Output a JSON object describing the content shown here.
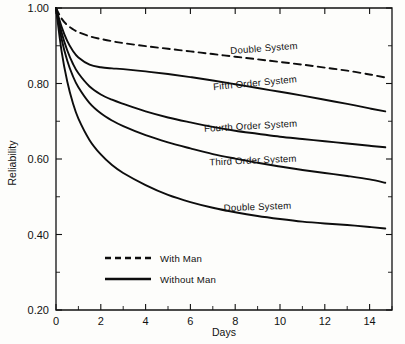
{
  "chart_data": {
    "type": "line",
    "title": "",
    "xlabel": "Days",
    "ylabel": "Reliability",
    "xlim": [
      0,
      15
    ],
    "ylim": [
      0.2,
      1.0
    ],
    "grid": false,
    "legend_position": "inside-lower-left",
    "x_ticks": [
      0,
      2,
      4,
      6,
      8,
      10,
      12,
      14
    ],
    "x_tick_labels": [
      "0",
      "2",
      "4",
      "6",
      "8",
      "10",
      "12",
      "14"
    ],
    "x_minor_ticks": [
      1,
      3,
      5,
      7,
      9,
      11,
      13,
      15
    ],
    "y_ticks": [
      0.2,
      0.4,
      0.6,
      0.8,
      1.0
    ],
    "y_tick_labels": [
      "0.20",
      "0.40",
      "0.60",
      "0.80",
      "1.00"
    ],
    "y_minor_ticks": [
      0.3,
      0.5,
      0.7,
      0.9
    ],
    "x": [
      0,
      0.25,
      0.5,
      0.75,
      1,
      1.5,
      2,
      2.5,
      3,
      4,
      5,
      6,
      7,
      8,
      9,
      10,
      11,
      12,
      13,
      14,
      14.7
    ],
    "series": [
      {
        "name": "Double System",
        "label": "Double System",
        "style": "dashed",
        "group": "With Man",
        "values": [
          1.0,
          0.972,
          0.955,
          0.944,
          0.936,
          0.925,
          0.918,
          0.912,
          0.907,
          0.899,
          0.892,
          0.885,
          0.878,
          0.871,
          0.864,
          0.857,
          0.85,
          0.842,
          0.834,
          0.824,
          0.816
        ]
      },
      {
        "name": "Fifth Order System",
        "label": "Fifth Order System",
        "style": "solid",
        "group": "Without Man",
        "values": [
          1.0,
          0.95,
          0.913,
          0.887,
          0.869,
          0.85,
          0.843,
          0.84,
          0.838,
          0.832,
          0.825,
          0.817,
          0.808,
          0.798,
          0.788,
          0.778,
          0.768,
          0.757,
          0.746,
          0.734,
          0.726
        ]
      },
      {
        "name": "Fourth Order System",
        "label": "Fourth Order System",
        "style": "solid",
        "group": "Without Man",
        "values": [
          1.0,
          0.935,
          0.888,
          0.853,
          0.827,
          0.792,
          0.771,
          0.757,
          0.746,
          0.726,
          0.71,
          0.697,
          0.685,
          0.675,
          0.667,
          0.659,
          0.653,
          0.647,
          0.641,
          0.635,
          0.631
        ]
      },
      {
        "name": "Third Order System",
        "label": "Third Order System",
        "style": "solid",
        "group": "Without Man",
        "values": [
          1.0,
          0.918,
          0.861,
          0.82,
          0.79,
          0.748,
          0.721,
          0.702,
          0.687,
          0.663,
          0.644,
          0.628,
          0.613,
          0.601,
          0.59,
          0.58,
          0.571,
          0.563,
          0.555,
          0.546,
          0.537
        ]
      },
      {
        "name": "Double System (Without Man)",
        "label": "Double System",
        "style": "solid",
        "group": "Without Man",
        "values": [
          1.0,
          0.885,
          0.806,
          0.749,
          0.707,
          0.65,
          0.612,
          0.584,
          0.563,
          0.531,
          0.505,
          0.486,
          0.471,
          0.459,
          0.449,
          0.441,
          0.434,
          0.429,
          0.425,
          0.42,
          0.416
        ]
      }
    ],
    "annotations": [
      {
        "text": "Double System",
        "x": 9.3,
        "y": 0.885,
        "rotation": -4.5
      },
      {
        "text": "Fifth Order System",
        "x": 8.9,
        "y": 0.793,
        "rotation": -5.5
      },
      {
        "text": "Fourth Order System",
        "x": 8.7,
        "y": 0.679,
        "rotation": -3.2
      },
      {
        "text": "Third Order System",
        "x": 8.8,
        "y": 0.588,
        "rotation": -2.6
      },
      {
        "text": "Double System",
        "x": 9.0,
        "y": 0.465,
        "rotation": -2.0
      }
    ],
    "legend": [
      {
        "label": "With Man",
        "style": "dashed"
      },
      {
        "label": "Without Man",
        "style": "solid"
      }
    ],
    "colors": {
      "line": "#0d0d0d",
      "axis": "#111111",
      "background": "#fdfdfb"
    }
  }
}
